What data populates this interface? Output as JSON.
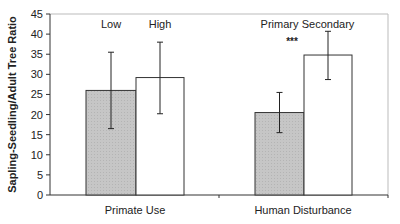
{
  "chart_data": {
    "type": "bar",
    "title": "",
    "xlabel": "",
    "ylabel": "Sapling-Seedling/Adult Tree Ratio",
    "ylim": [
      0,
      45
    ],
    "yticks": [
      0,
      5,
      10,
      15,
      20,
      25,
      30,
      35,
      40,
      45
    ],
    "grid": false,
    "legend": "none (bar labels placed above each bar)",
    "groups": [
      {
        "category": "Primate Use",
        "bars": [
          {
            "label": "Low",
            "value": 26,
            "error_low": 16.5,
            "error_high": 35.5,
            "fill": "#c8c8c8"
          },
          {
            "label": "High",
            "value": 29.2,
            "error_low": 20.2,
            "error_high": 38,
            "fill": "#ffffff"
          }
        ],
        "annotation": ""
      },
      {
        "category": "Human Disturbance",
        "bars": [
          {
            "label": "Primary",
            "value": 20.5,
            "error_low": 15.5,
            "error_high": 25.5,
            "fill": "#c8c8c8"
          },
          {
            "label": "Secondary",
            "value": 34.8,
            "error_low": 28.7,
            "error_high": 40.7,
            "fill": "#ffffff"
          }
        ],
        "annotation": "***"
      }
    ],
    "categories": [
      "Primate Use",
      "Human Disturbance"
    ],
    "series": [
      {
        "name": "Low / Primary",
        "values": [
          26,
          20.5
        ]
      },
      {
        "name": "High / Secondary",
        "values": [
          29.2,
          34.8
        ]
      }
    ]
  }
}
